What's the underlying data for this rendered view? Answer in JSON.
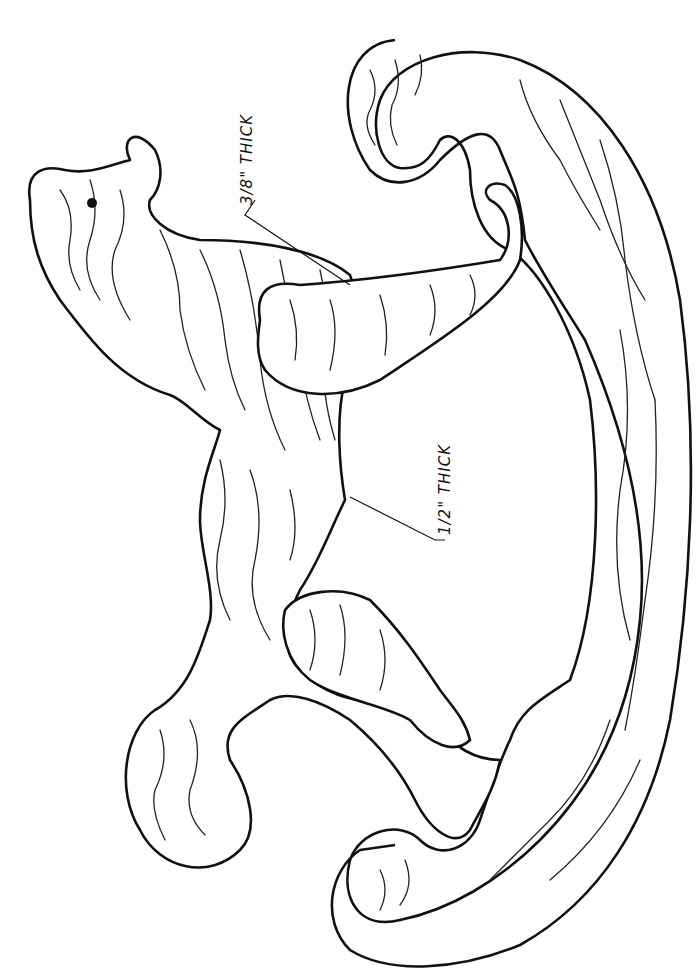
{
  "diagram": {
    "labels": [
      {
        "id": "thin-piece",
        "text": "3/8\" THICK"
      },
      {
        "id": "thick-piece",
        "text": "1/2\" THICK"
      }
    ],
    "parts": [
      "horse-body",
      "front-leg",
      "rear-leg",
      "rocker-base",
      "eye"
    ]
  }
}
